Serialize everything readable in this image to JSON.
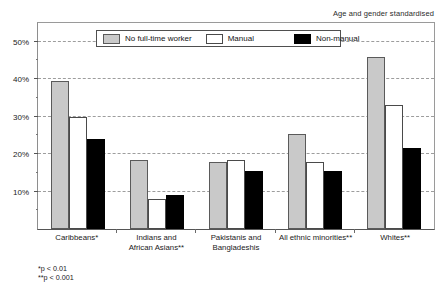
{
  "header": {
    "note": "Age and gender standardised"
  },
  "legend": {
    "items": [
      {
        "label": "No full-time worker",
        "swatch": "legend-swatch-gray"
      },
      {
        "label": "Manual",
        "swatch": "legend-swatch-white"
      },
      {
        "label": "Non-manual",
        "swatch": "legend-swatch-black"
      }
    ]
  },
  "footnotes": {
    "line1": "*p < 0.01",
    "line2": "**p < 0.001"
  },
  "chart_data": {
    "type": "bar",
    "title": "",
    "subtitle": "Age and gender standardised",
    "xlabel": "",
    "ylabel": "",
    "ylim": [
      0,
      55
    ],
    "grid": true,
    "legend_position": "top-center-inside",
    "ytick_values": [
      10,
      20,
      30,
      40,
      50
    ],
    "ytick_labels": [
      "10%",
      "20%",
      "30%",
      "40%",
      "50%"
    ],
    "yminor_values": [
      5,
      15,
      25,
      35,
      45
    ],
    "gridline_values": [
      10,
      20,
      30,
      40,
      50
    ],
    "categories": [
      "Caribbeans*",
      "Indians and African Asians**",
      "Pakistanis and Bangladeshis",
      "All ethnic minorities**",
      "Whites**"
    ],
    "category_lines": [
      [
        "Caribbeans*"
      ],
      [
        "Indians and",
        "African Asians**"
      ],
      [
        "Pakistanis and",
        "Bangladeshis"
      ],
      [
        "All ethnic minorities**"
      ],
      [
        "Whites**"
      ]
    ],
    "series": [
      {
        "name": "No full-time worker",
        "color": "#c9c9c9",
        "values": [
          39.5,
          18.5,
          18.0,
          25.5,
          46.0
        ]
      },
      {
        "name": "Manual",
        "color": "#ffffff",
        "values": [
          30.0,
          8.0,
          18.5,
          18.0,
          33.0
        ]
      },
      {
        "name": "Non-manual",
        "color": "#000000",
        "values": [
          24.0,
          9.0,
          15.5,
          15.5,
          21.5
        ]
      }
    ]
  }
}
